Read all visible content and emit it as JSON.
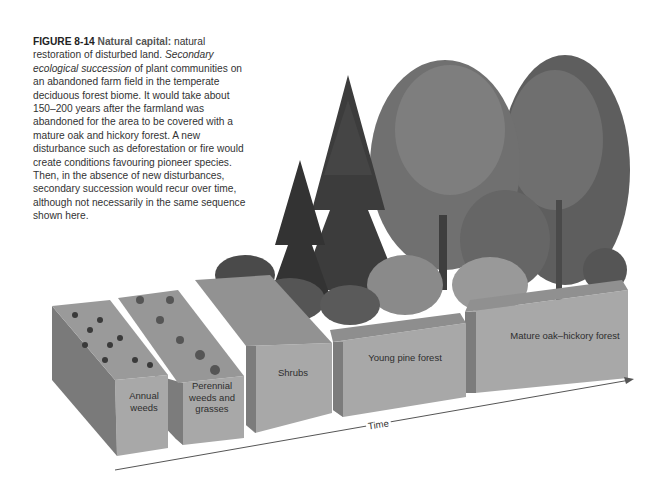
{
  "figure": {
    "number": "FIGURE 8-14",
    "title": "Natural capital:",
    "caption_lead": " natural restoration of disturbed land. ",
    "caption_italic": "Secondary ecological succession",
    "caption_rest": " of plant communities on an abandoned farm field in the temperate deciduous forest biome. It would take about 150–200 years after the farmland was abandoned for the area to be covered with a mature oak and hickory forest. A new disturbance such as deforestation or fire would create conditions favouring pioneer species. Then, in the absence of new disturbances, secondary succession would recur over time, although not necessarily in the same sequence shown here."
  },
  "stages": [
    {
      "id": "annual-weeds",
      "line1": "Annual",
      "line2": "weeds"
    },
    {
      "id": "perennial",
      "line1": "Perennial",
      "line2": "weeds and",
      "line3": "grasses"
    },
    {
      "id": "shrubs",
      "line1": "Shrubs"
    },
    {
      "id": "young-pine",
      "line1": "Young pine forest"
    },
    {
      "id": "mature-oak",
      "line1": "Mature oak–hickory forest"
    }
  ],
  "axis": {
    "label": "Time",
    "direction": "arrow-right"
  },
  "colors": {
    "block_front": "#a9a9a9",
    "block_side": "#7f7f7f",
    "block_top": "#999999",
    "foliage_dark": "#3a3a3a",
    "foliage_mid": "#6a6a6a",
    "foliage_light": "#8c8c8c",
    "text": "#333333"
  }
}
